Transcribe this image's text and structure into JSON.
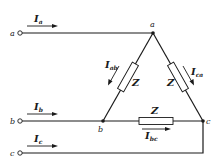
{
  "diagram": {
    "type": "delta-connected three-phase load",
    "terminals": [
      {
        "label": "a"
      },
      {
        "label": "b"
      },
      {
        "label": "c"
      }
    ],
    "nodes": [
      {
        "label": "a"
      },
      {
        "label": "b"
      },
      {
        "label": "c"
      }
    ],
    "line_currents": [
      {
        "main": "I",
        "sub": "a"
      },
      {
        "main": "I",
        "sub": "b"
      },
      {
        "main": "I",
        "sub": "c"
      }
    ],
    "phase_currents": [
      {
        "main": "I",
        "sub": "ab"
      },
      {
        "main": "I",
        "sub": "ca"
      },
      {
        "main": "I",
        "sub": "bc"
      }
    ],
    "impedances": [
      {
        "label": "Z",
        "branch": "ab"
      },
      {
        "label": "Z",
        "branch": "ca"
      },
      {
        "label": "Z",
        "branch": "bc"
      }
    ],
    "colors": {
      "line": "#1a1a1a",
      "background": "#ffffff"
    }
  }
}
